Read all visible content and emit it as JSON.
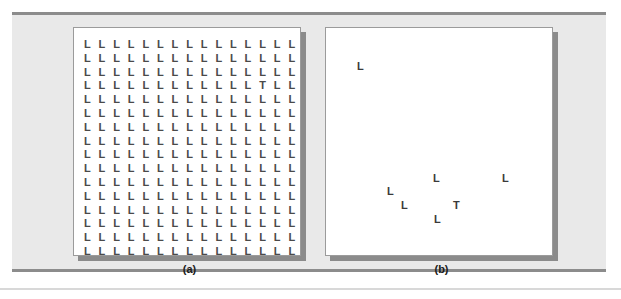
{
  "figure": {
    "type": "visual-search-display",
    "background_color": "#e9e9e9",
    "rule_color": "#8c8c8c",
    "stage_color": "#ffffff",
    "letter_color": "#4a4a4a",
    "target_letter": "T",
    "distractor_letter": "L"
  },
  "panels": [
    {
      "id": "panel-a",
      "caption": "(a)",
      "layout": "grid",
      "grid": {
        "columns": 15,
        "rows": 16,
        "col_step": 14.6,
        "row_step": 13.8,
        "origin_x": 10,
        "origin_y": 11
      },
      "target": {
        "letter": "T",
        "row": 4,
        "col": 13
      },
      "distractor_count": 239,
      "total_items": 240
    },
    {
      "id": "panel-b",
      "caption": "(b)",
      "layout": "sparse",
      "items": [
        {
          "letter": "L",
          "x": 31,
          "y": 33
        },
        {
          "letter": "L",
          "x": 107,
          "y": 145
        },
        {
          "letter": "L",
          "x": 176,
          "y": 145
        },
        {
          "letter": "L",
          "x": 61,
          "y": 158
        },
        {
          "letter": "L",
          "x": 75,
          "y": 172
        },
        {
          "letter": "T",
          "x": 127,
          "y": 172
        },
        {
          "letter": "L",
          "x": 108,
          "y": 186
        }
      ],
      "target": {
        "letter": "T",
        "x": 127,
        "y": 172
      },
      "distractor_count": 6,
      "total_items": 7
    }
  ],
  "chart_data": {
    "type": "scatter",
    "title": "",
    "xlabel": "",
    "ylabel": "",
    "subplots": [
      {
        "name": "(a)",
        "description": "Dense 15x16 grid of letter L distractors with a single letter T target at row 4, column 13",
        "set_size": 240,
        "target_present": true
      },
      {
        "name": "(b)",
        "description": "Sparse display of 6 letter L distractors with a single letter T target",
        "set_size": 7,
        "target_present": true
      }
    ]
  }
}
